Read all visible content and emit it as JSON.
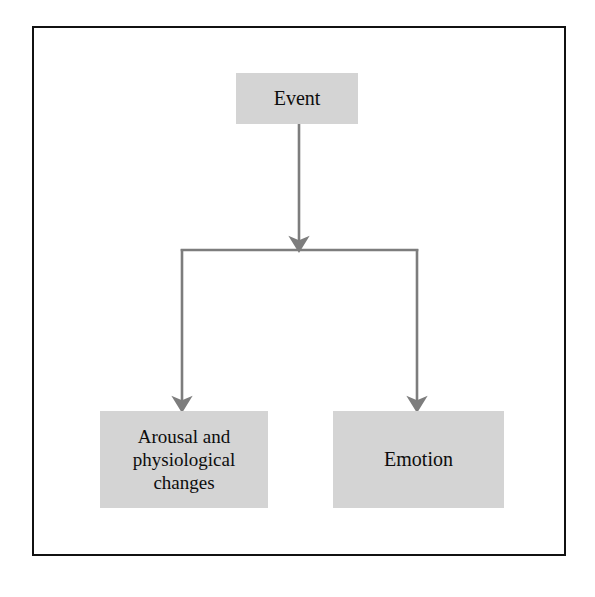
{
  "diagram": {
    "frame_color": "#111111",
    "node_fill": "#d4d4d4",
    "connector_color": "#7d7d7d",
    "background": "#ffffff",
    "nodes": [
      {
        "id": "event",
        "label": "Event",
        "lines": [
          "Event"
        ]
      },
      {
        "id": "arousal",
        "label": "Arousal and physiological changes",
        "lines": [
          "Arousal and",
          "physiological",
          "changes"
        ]
      },
      {
        "id": "emotion",
        "label": "Emotion",
        "lines": [
          "Emotion"
        ]
      }
    ],
    "connectors": [
      {
        "id": "event-to-split",
        "from": "event",
        "to": "split-junction",
        "arrow": true
      },
      {
        "id": "split-to-arousal",
        "from": "split-junction",
        "to": "arousal",
        "arrow": true
      },
      {
        "id": "split-to-emotion",
        "from": "split-junction",
        "to": "emotion",
        "arrow": true
      }
    ]
  }
}
